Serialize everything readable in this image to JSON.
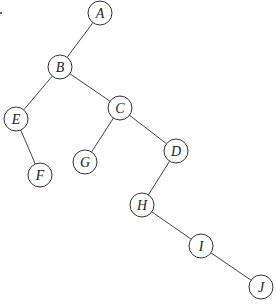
{
  "diagram": {
    "type": "binary-tree",
    "nodes": [
      {
        "id": "A",
        "label": "A",
        "x": 100,
        "y": 13
      },
      {
        "id": "B",
        "label": "B",
        "x": 60,
        "y": 67
      },
      {
        "id": "C",
        "label": "C",
        "x": 120,
        "y": 108
      },
      {
        "id": "D",
        "label": "D",
        "x": 176,
        "y": 151
      },
      {
        "id": "E",
        "label": "E",
        "x": 16,
        "y": 119
      },
      {
        "id": "F",
        "label": "F",
        "x": 40,
        "y": 175
      },
      {
        "id": "G",
        "label": "G",
        "x": 85,
        "y": 162
      },
      {
        "id": "H",
        "label": "H",
        "x": 142,
        "y": 205
      },
      {
        "id": "I",
        "label": "I",
        "x": 201,
        "y": 246
      },
      {
        "id": "J",
        "label": "J",
        "x": 261,
        "y": 287
      }
    ],
    "edges": [
      [
        "A",
        "B"
      ],
      [
        "B",
        "E"
      ],
      [
        "B",
        "C"
      ],
      [
        "E",
        "F"
      ],
      [
        "C",
        "G"
      ],
      [
        "C",
        "D"
      ],
      [
        "D",
        "H"
      ],
      [
        "H",
        "I"
      ],
      [
        "I",
        "J"
      ]
    ],
    "node_radius": 12
  }
}
